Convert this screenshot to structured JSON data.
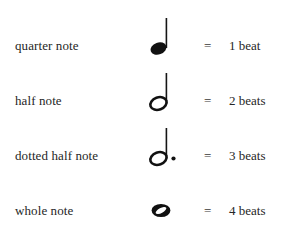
{
  "page": {
    "background_color": "#ffffff",
    "text_color": "#262626",
    "ink_color": "#111111"
  },
  "legend": {
    "equals_sign": "=",
    "dot_symbol": "·"
  },
  "rows": [
    {
      "label": "quarter note",
      "glyph": "quarter-note-glyph",
      "glyph_description": "filled oval notehead with upward stem",
      "filled": true,
      "has_stem": true,
      "has_dot": false,
      "equals": "=",
      "value": "1 beat",
      "beats": 1
    },
    {
      "label": "half note",
      "glyph": "half-note-glyph",
      "glyph_description": "hollow oval notehead with upward stem",
      "filled": false,
      "has_stem": true,
      "has_dot": false,
      "equals": "=",
      "value": "2 beats",
      "beats": 2
    },
    {
      "label": "dotted half note",
      "glyph": "dotted-half-note-glyph",
      "glyph_description": "hollow oval notehead with upward stem and augmentation dot",
      "filled": false,
      "has_stem": true,
      "has_dot": true,
      "equals": "=",
      "value": "3 beats",
      "beats": 3
    },
    {
      "label": "whole note",
      "glyph": "whole-note-glyph",
      "glyph_description": "hollow oval notehead with no stem",
      "filled": false,
      "has_stem": false,
      "has_dot": false,
      "equals": "=",
      "value": "4 beats",
      "beats": 4
    }
  ]
}
